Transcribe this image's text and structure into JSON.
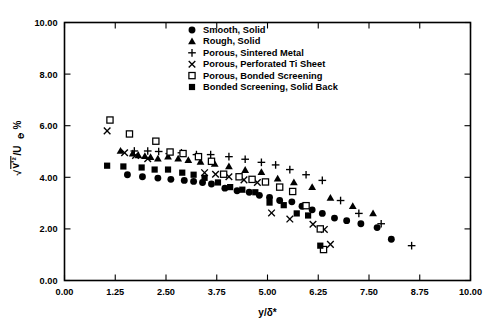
{
  "chart_data": {
    "type": "scatter",
    "title": "",
    "xlabel": "y/δ*",
    "ylabel": "√(v'²)/Uₑ, %",
    "xlim": [
      0.0,
      10.0
    ],
    "ylim": [
      0.0,
      10.0
    ],
    "xticks": [
      "0.00",
      "1.25",
      "2.50",
      "3.75",
      "5.00",
      "6.25",
      "7.50",
      "8.75",
      "10.00"
    ],
    "xtick_values": [
      0.0,
      1.25,
      2.5,
      3.75,
      5.0,
      6.25,
      7.5,
      8.75,
      10.0
    ],
    "yticks": [
      "0.00",
      "2.00",
      "4.00",
      "6.00",
      "8.00",
      "10.00"
    ],
    "ytick_values": [
      0.0,
      2.0,
      4.0,
      6.0,
      8.0,
      10.0
    ],
    "grid": false,
    "legend_position": "top-center",
    "series": [
      {
        "name": "Smooth, Solid",
        "marker": "filled-circle",
        "color": "#000000",
        "points": [
          [
            1.55,
            4.1
          ],
          [
            1.92,
            4.02
          ],
          [
            2.3,
            3.97
          ],
          [
            2.62,
            3.92
          ],
          [
            2.95,
            3.88
          ],
          [
            3.18,
            3.84
          ],
          [
            3.4,
            3.8
          ],
          [
            3.62,
            3.74
          ],
          [
            3.95,
            3.58
          ],
          [
            4.25,
            3.48
          ],
          [
            4.55,
            3.42
          ],
          [
            4.8,
            3.3
          ],
          [
            5.05,
            3.22
          ],
          [
            5.3,
            3.1
          ],
          [
            5.6,
            3.05
          ],
          [
            5.85,
            2.88
          ],
          [
            6.1,
            2.74
          ],
          [
            6.35,
            2.6
          ],
          [
            6.65,
            2.42
          ],
          [
            6.95,
            2.32
          ],
          [
            7.3,
            2.2
          ],
          [
            7.7,
            2.05
          ],
          [
            8.05,
            1.6
          ]
        ]
      },
      {
        "name": "Rough, Solid",
        "marker": "filled-triangle",
        "color": "#000000",
        "points": [
          [
            1.38,
            5.02
          ],
          [
            1.68,
            4.92
          ],
          [
            1.82,
            4.85
          ],
          [
            1.98,
            4.82
          ],
          [
            2.12,
            4.78
          ],
          [
            2.3,
            4.72
          ],
          [
            2.55,
            4.8
          ],
          [
            2.8,
            4.72
          ],
          [
            3.05,
            4.66
          ],
          [
            3.35,
            4.6
          ],
          [
            3.7,
            4.52
          ],
          [
            4.05,
            4.42
          ],
          [
            4.45,
            4.28
          ],
          [
            4.85,
            4.2
          ],
          [
            5.25,
            3.95
          ],
          [
            5.65,
            3.8
          ],
          [
            6.1,
            3.62
          ],
          [
            6.55,
            3.2
          ],
          [
            7.1,
            2.88
          ],
          [
            7.6,
            2.6
          ]
        ]
      },
      {
        "name": "Porous, Sintered Metal",
        "marker": "plus",
        "color": "#000000",
        "points": [
          [
            1.72,
            5.02
          ],
          [
            2.05,
            5.02
          ],
          [
            2.32,
            5.0
          ],
          [
            2.58,
            4.92
          ],
          [
            2.88,
            4.95
          ],
          [
            3.25,
            4.88
          ],
          [
            3.6,
            4.88
          ],
          [
            4.05,
            4.8
          ],
          [
            4.45,
            4.7
          ],
          [
            4.85,
            4.58
          ],
          [
            5.2,
            4.48
          ],
          [
            5.55,
            4.3
          ],
          [
            5.95,
            4.1
          ],
          [
            6.35,
            3.88
          ],
          [
            6.8,
            3.1
          ],
          [
            7.25,
            2.6
          ],
          [
            7.8,
            2.2
          ],
          [
            8.55,
            1.35
          ]
        ]
      },
      {
        "name": "Porous, Perforated Ti Sheet",
        "marker": "x",
        "color": "#000000",
        "points": [
          [
            1.05,
            5.8
          ],
          [
            1.48,
            4.95
          ],
          [
            1.75,
            4.85
          ],
          [
            2.05,
            4.72
          ],
          [
            3.45,
            4.18
          ],
          [
            3.72,
            4.12
          ],
          [
            4.05,
            4.02
          ],
          [
            4.42,
            3.9
          ],
          [
            4.75,
            3.8
          ],
          [
            5.1,
            2.62
          ],
          [
            5.55,
            2.38
          ],
          [
            6.12,
            2.18
          ],
          [
            6.4,
            1.98
          ],
          [
            6.55,
            1.4
          ]
        ]
      },
      {
        "name": "Porous, Bonded Screening",
        "marker": "open-square",
        "color": "#000000",
        "points": [
          [
            1.12,
            6.22
          ],
          [
            1.6,
            5.68
          ],
          [
            2.25,
            5.4
          ],
          [
            2.6,
            4.98
          ],
          [
            2.92,
            4.92
          ],
          [
            3.3,
            4.8
          ],
          [
            3.62,
            4.62
          ],
          [
            3.92,
            4.12
          ],
          [
            4.3,
            4.02
          ],
          [
            4.62,
            3.92
          ],
          [
            4.95,
            3.82
          ],
          [
            5.3,
            3.62
          ],
          [
            5.62,
            3.45
          ],
          [
            5.95,
            2.9
          ],
          [
            6.3,
            2.0
          ],
          [
            6.38,
            1.2
          ]
        ]
      },
      {
        "name": "Bonded Screening, Solid Back",
        "marker": "filled-square",
        "color": "#000000",
        "points": [
          [
            1.05,
            4.45
          ],
          [
            1.45,
            4.42
          ],
          [
            1.9,
            4.38
          ],
          [
            2.22,
            4.3
          ],
          [
            2.55,
            4.3
          ],
          [
            2.9,
            4.18
          ],
          [
            3.18,
            4.1
          ],
          [
            3.45,
            3.98
          ],
          [
            3.78,
            3.8
          ],
          [
            4.08,
            3.62
          ],
          [
            4.38,
            3.52
          ],
          [
            4.7,
            3.42
          ],
          [
            5.05,
            3.02
          ],
          [
            5.4,
            2.92
          ],
          [
            5.72,
            2.6
          ],
          [
            6.0,
            2.52
          ],
          [
            6.3,
            1.35
          ]
        ]
      }
    ]
  },
  "axes": {
    "x_title": "y/δ*",
    "y_title_sqrt": "√",
    "y_title_num": "v'²",
    "y_title_rest": "/U",
    "y_title_sub": "e",
    "y_title_unit": ", %"
  },
  "legend": {
    "items": [
      {
        "label": "Smooth, Solid",
        "marker": "filled-circle"
      },
      {
        "label": "Rough, Solid",
        "marker": "filled-triangle"
      },
      {
        "label": "Porous, Sintered Metal",
        "marker": "plus"
      },
      {
        "label": "Porous, Perforated Ti Sheet",
        "marker": "x"
      },
      {
        "label": "Porous, Bonded Screening",
        "marker": "open-square"
      },
      {
        "label": "Bonded Screening, Solid Back",
        "marker": "filled-square"
      }
    ]
  },
  "colors": {
    "ink": "#000000",
    "paper": "#ffffff"
  }
}
